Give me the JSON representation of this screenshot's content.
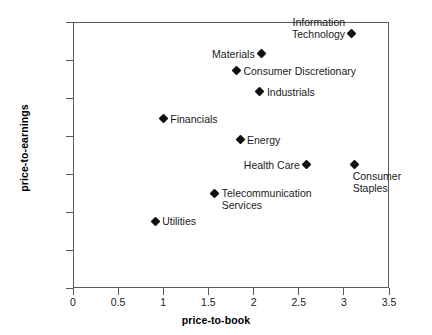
{
  "chart_data": {
    "type": "scatter",
    "title": "",
    "xlabel": "price-to-book",
    "ylabel": "price-to-earnings",
    "xlim": [
      0,
      3.5
    ],
    "ylim": [
      0,
      35
    ],
    "xticks": [
      "0",
      "0.5",
      "1",
      "1.5",
      "2",
      "2.5",
      "3",
      "3.5"
    ],
    "xtick_values": [
      0,
      0.5,
      1,
      1.5,
      2,
      2.5,
      3,
      3.5
    ],
    "yticks": [
      "0",
      "5",
      "10",
      "15",
      "20",
      "25",
      "30",
      "35"
    ],
    "ytick_values": [
      0,
      5,
      10,
      15,
      20,
      25,
      30,
      35
    ],
    "grid": false,
    "legend": "none",
    "marker_shape": "diamond",
    "marker_color": "#111111",
    "points": [
      {
        "label": "Information\nTechnology",
        "x": 3.08,
        "y": 33.5,
        "label_pos": "aboveleft"
      },
      {
        "label": "Materials",
        "x": 2.09,
        "y": 30.8,
        "label_pos": "left"
      },
      {
        "label": "Consumer Discretionary",
        "x": 1.81,
        "y": 28.6,
        "label_pos": "right"
      },
      {
        "label": "Industrials",
        "x": 2.07,
        "y": 25.8,
        "label_pos": "right"
      },
      {
        "label": "Financials",
        "x": 1.0,
        "y": 22.3,
        "label_pos": "right"
      },
      {
        "label": "Energy",
        "x": 1.85,
        "y": 19.5,
        "label_pos": "right"
      },
      {
        "label": "Health Care",
        "x": 2.59,
        "y": 16.2,
        "label_pos": "left"
      },
      {
        "label": "Consumer\nStaples",
        "x": 3.12,
        "y": 16.2,
        "label_pos": "below"
      },
      {
        "label": "Telecommunication\nServices",
        "x": 1.57,
        "y": 12.5,
        "label_pos": "right"
      },
      {
        "label": "Utilities",
        "x": 0.91,
        "y": 8.8,
        "label_pos": "right"
      }
    ]
  }
}
